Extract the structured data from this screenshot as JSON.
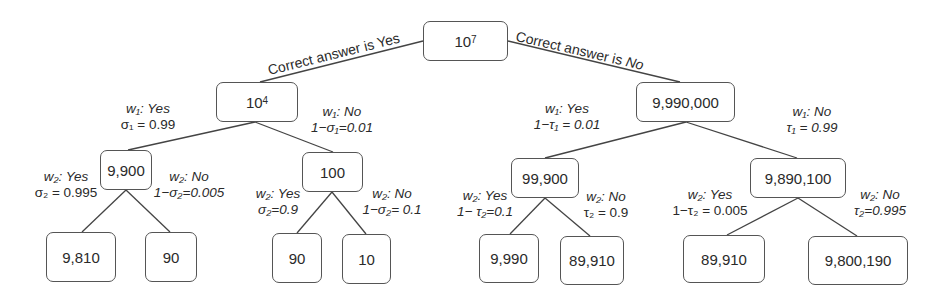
{
  "diagram": {
    "type": "probability-tree",
    "root": {
      "base": "10",
      "exp": "7"
    },
    "branch_labels": {
      "yes": "Correct answer is Yes",
      "no_prefix": "Correct answer is ",
      "no_italic": "No"
    },
    "nodes": {
      "yes": {
        "base": "10",
        "exp": "4"
      },
      "no": {
        "value": "9,990,000"
      },
      "yes_yes": {
        "value": "9,900"
      },
      "yes_no": {
        "value": "100"
      },
      "no_yes": {
        "value": "99,900"
      },
      "no_no": {
        "value": "9,890,100"
      },
      "leaves": [
        {
          "value": "9,810"
        },
        {
          "value": "90"
        },
        {
          "value": "90"
        },
        {
          "value": "10"
        },
        {
          "value": "9,990"
        },
        {
          "value": "89,910"
        },
        {
          "value": "89,910"
        },
        {
          "value": "9,800,190"
        }
      ]
    },
    "edge_labels": {
      "w1_yes_left": {
        "line1": "w₁: Yes",
        "line2": "σ₁ = 0.99"
      },
      "w1_no_left": {
        "line1": "w₁: No",
        "line2": "1−σ₁=0.01"
      },
      "w1_yes_right": {
        "line1": "w₁: Yes",
        "line2": "1−τ₁ = 0.01"
      },
      "w1_no_right": {
        "line1": "w₁: No",
        "line2": "τ₁ = 0.99"
      },
      "w2_yes_a": {
        "line1": "w₂: Yes",
        "line2": "σ₂ = 0.995"
      },
      "w2_no_a": {
        "line1": "w₂: No",
        "line2": "1−σ₂=0.005"
      },
      "w2_yes_b": {
        "line1": "w₂: Yes",
        "line2": "σ₂=0.9"
      },
      "w2_no_b": {
        "line1": "w₂: No",
        "line2": "1−σ₂= 0.1"
      },
      "w2_yes_c": {
        "line1": "w₂: Yes",
        "line2": "1− τ₂=0.1"
      },
      "w2_no_c": {
        "line1": "w₂: No",
        "line2": "τ₂ = 0.9"
      },
      "w2_yes_d": {
        "line1": "w₂: Yes",
        "line2": "1−τ₂ = 0.005"
      },
      "w2_no_d": {
        "line1": "w₂: No",
        "line2": "τ₂=0.995"
      }
    }
  }
}
